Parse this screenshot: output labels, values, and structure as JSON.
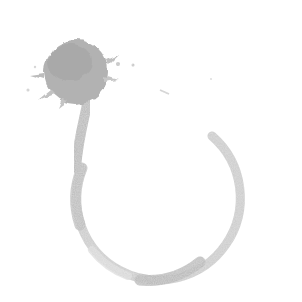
{
  "image": {
    "description": "Grayscale ink splatter with a brush stroke forming an open circular ring",
    "background_color": "#ffffff",
    "ink_color_dark": "#a8a8a8",
    "ink_color_mid": "#bdbdbd",
    "ink_color_light": "#d6d6d6"
  },
  "elements": {
    "splat": {
      "label": "ink splatter blob",
      "cx": 76,
      "cy": 72,
      "r": 33
    },
    "ring": {
      "label": "brush stroke ring",
      "cx": 160,
      "cy": 200,
      "r": 82
    },
    "tail": {
      "label": "stroke connecting splat to ring"
    }
  }
}
